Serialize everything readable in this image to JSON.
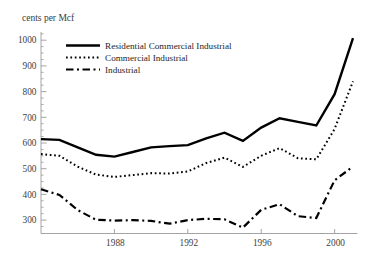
{
  "figure": {
    "y_axis_title": "cents per Mcf"
  },
  "legend": {
    "items": [
      {
        "key": "residential",
        "label": "Residential Commercial Industrial",
        "style": "solid"
      },
      {
        "key": "commercial",
        "label": "Commercial Industrial",
        "style": "dotted"
      },
      {
        "key": "industrial",
        "label": "Industrial",
        "style": "dashdot"
      }
    ]
  },
  "chart_data": {
    "type": "line",
    "title": "",
    "xlabel": "",
    "ylabel": "cents per Mcf",
    "grid": false,
    "legend_position": "upper-left-inside",
    "line_color": "#000000",
    "axis_color": "#9a9a9a",
    "x": [
      1984,
      1985,
      1986,
      1987,
      1988,
      1989,
      1990,
      1991,
      1992,
      1993,
      1994,
      1995,
      1996,
      1997,
      1998,
      1999,
      2000,
      2001
    ],
    "series": [
      {
        "key": "residential",
        "name": "Residential Commercial Industrial",
        "style": "solid",
        "values": [
          615,
          612,
          583,
          554,
          547,
          565,
          583,
          588,
          592,
          618,
          640,
          608,
          660,
          696,
          682,
          668,
          790,
          1008
        ]
      },
      {
        "key": "commercial",
        "name": "Commercial Industrial",
        "style": "dotted",
        "values": [
          557,
          550,
          508,
          477,
          468,
          475,
          483,
          481,
          489,
          522,
          543,
          507,
          550,
          580,
          541,
          536,
          655,
          840
        ]
      },
      {
        "key": "industrial",
        "name": "Industrial",
        "style": "dashdot",
        "values": [
          420,
          398,
          339,
          301,
          298,
          300,
          297,
          286,
          300,
          305,
          303,
          271,
          340,
          362,
          315,
          308,
          455,
          508
        ]
      }
    ],
    "x_ticks": [
      1988,
      1992,
      1996,
      2000
    ],
    "y_ticks": [
      300,
      400,
      500,
      600,
      700,
      800,
      900,
      1000
    ],
    "y_minor_tick_step": 25,
    "xlim": [
      1984,
      2001
    ],
    "ylim": [
      250,
      1025
    ]
  }
}
